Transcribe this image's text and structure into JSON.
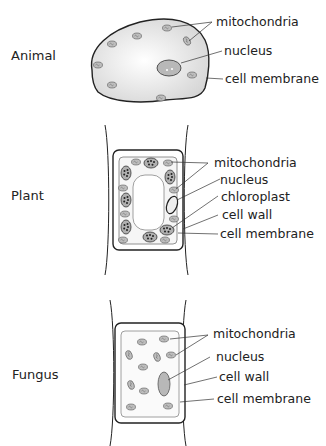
{
  "diagram": {
    "panels": [
      {
        "name": "Animal",
        "labels": [
          "mitochondria",
          "nucleus",
          "cell membrane"
        ]
      },
      {
        "name": "Plant",
        "labels": [
          "mitochondria",
          "nucleus",
          "chloroplast",
          "cell wall",
          "cell membrane"
        ]
      },
      {
        "name": "Fungus",
        "labels": [
          "mitochondria",
          "nucleus",
          "cell wall",
          "cell membrane"
        ]
      }
    ]
  }
}
